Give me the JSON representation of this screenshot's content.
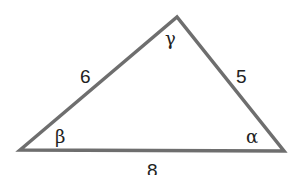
{
  "diagram": {
    "type": "triangle",
    "stroke_color": "#6e6e6e",
    "vertices": {
      "left": [
        20,
        150
      ],
      "top": [
        177,
        17
      ],
      "right": [
        284,
        151
      ]
    },
    "sides": {
      "left_top": "6",
      "top_right": "5",
      "bottom": "8"
    },
    "angles": {
      "top": "γ",
      "left": "β",
      "right": "α"
    }
  }
}
